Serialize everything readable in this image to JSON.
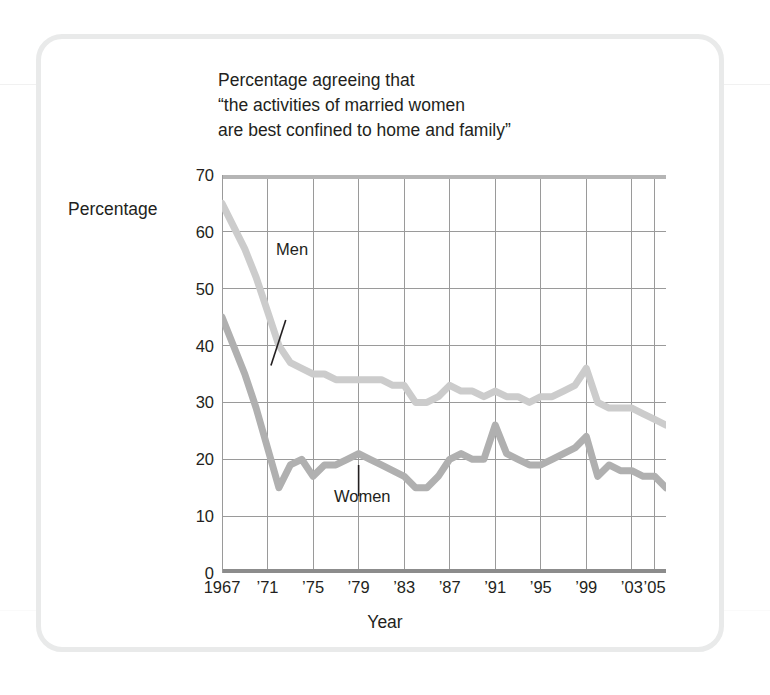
{
  "figure": {
    "title": "Percentage agreeing that\n“the activities of married women\nare best confined to home and family”",
    "y_axis_title": "Percentage",
    "x_axis_title": "Year",
    "men_label": "Men",
    "women_label": "Women",
    "colors": {
      "men_line": "#cccccc",
      "women_line": "#b0b0b0",
      "grid": "#9a9a9a",
      "axis": "#808080",
      "frame": "#e9eaea",
      "text": "#231f20"
    }
  },
  "chart_data": {
    "type": "line",
    "title": "Percentage agreeing that “the activities of married women are best confined to home and family”",
    "xlabel": "Year",
    "ylabel": "Percentage",
    "xlim": [
      1967,
      2006
    ],
    "ylim": [
      0,
      70
    ],
    "yticks": [
      0,
      10,
      20,
      30,
      40,
      50,
      60,
      70
    ],
    "ytick_labels": [
      "0",
      "10",
      "20",
      "30",
      "40",
      "50",
      "60",
      "70"
    ],
    "xticks": [
      1967,
      1971,
      1975,
      1979,
      1983,
      1987,
      1991,
      1995,
      1999,
      2003,
      2005
    ],
    "xtick_labels": [
      "1967",
      "’71",
      "’75",
      "’79",
      "’83",
      "’87",
      "’91",
      "’95",
      "’99",
      "’03",
      "’05"
    ],
    "grid": true,
    "legend": "inline-annotations",
    "x": [
      1967,
      1968,
      1969,
      1970,
      1971,
      1972,
      1973,
      1974,
      1975,
      1976,
      1977,
      1978,
      1979,
      1980,
      1981,
      1982,
      1983,
      1984,
      1985,
      1986,
      1987,
      1988,
      1989,
      1990,
      1991,
      1992,
      1993,
      1994,
      1995,
      1996,
      1997,
      1998,
      1999,
      2000,
      2001,
      2002,
      2003,
      2004,
      2005,
      2006
    ],
    "series": [
      {
        "name": "Men",
        "color": "#cccccc",
        "values": [
          65,
          61,
          57,
          52,
          46,
          40,
          37,
          36,
          35,
          35,
          34,
          34,
          34,
          34,
          34,
          33,
          33,
          30,
          30,
          31,
          33,
          32,
          32,
          31,
          32,
          31,
          31,
          30,
          31,
          31,
          32,
          33,
          36,
          30,
          29,
          29,
          29,
          28,
          27,
          26
        ]
      },
      {
        "name": "Women",
        "color": "#b0b0b0",
        "values": [
          45,
          40,
          35,
          29,
          22,
          15,
          19,
          20,
          17,
          19,
          19,
          20,
          21,
          20,
          19,
          18,
          17,
          15,
          15,
          17,
          20,
          21,
          20,
          20,
          26,
          21,
          20,
          19,
          19,
          20,
          21,
          22,
          24,
          17,
          19,
          18,
          18,
          17,
          17,
          15
        ]
      }
    ],
    "annotations": [
      {
        "text": "Men",
        "x": 1972,
        "y": 47
      },
      {
        "text": "Women",
        "x": 1980,
        "y": 8
      }
    ]
  }
}
